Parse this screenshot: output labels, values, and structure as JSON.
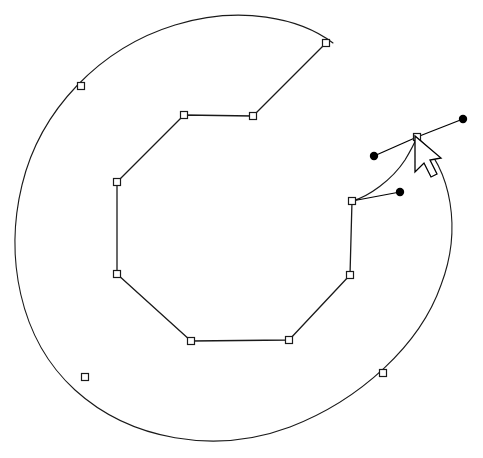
{
  "canvas": {
    "name": "vector-editing-canvas",
    "width": 483,
    "height": 458,
    "background_color": "#ffffff",
    "stroke_color": "#1a1a1a",
    "anchor_fill_color": "#ffffff",
    "anchor_stroke_color": "#1a1a1a",
    "handle_color": "#000000",
    "cursor_fill_color": "#ffffff",
    "cursor_stroke_color": "#000000"
  },
  "shapes": {
    "outer_arc": {
      "name": "outer-arc-path",
      "description": "large open circular arc forming a C shape, gap at upper right",
      "stroke_width": 1.1,
      "path": "M 417 137 C 452 170 462 230 441 285 C 420 345 360 400 290 427 C 215 455 130 440 75 390 C 18 338 5 255 22 185 C 40 110 100 48 175 25 C 240 5 300 18 333 43",
      "anchors": [
        {
          "name": "anchor-outer-top-right",
          "x": 417,
          "y": 137
        },
        {
          "name": "anchor-outer-bottom-right",
          "x": 383,
          "y": 373
        },
        {
          "name": "anchor-outer-bottom-left",
          "x": 85,
          "y": 377
        },
        {
          "name": "anchor-outer-top-left",
          "x": 81,
          "y": 86
        }
      ]
    },
    "inner_polygon": {
      "name": "inner-polygon-path",
      "description": "open polyline forming inner C shape with straight segments",
      "stroke_width": 1.3,
      "vertices": [
        {
          "name": "vertex-top-right",
          "x": 326,
          "y": 43
        },
        {
          "name": "vertex-upper-mid-right",
          "x": 253,
          "y": 116
        },
        {
          "name": "vertex-upper-mid-left",
          "x": 184,
          "y": 115
        },
        {
          "name": "vertex-left-upper",
          "x": 117,
          "y": 182
        },
        {
          "name": "vertex-left-lower",
          "x": 117,
          "y": 274
        },
        {
          "name": "vertex-bottom-left",
          "x": 191,
          "y": 341
        },
        {
          "name": "vertex-bottom-right",
          "x": 289,
          "y": 340
        },
        {
          "name": "vertex-right-lower",
          "x": 350,
          "y": 275
        },
        {
          "name": "vertex-right-upper",
          "x": 352,
          "y": 201
        }
      ]
    },
    "bezier_handles": {
      "name": "bezier-control-handles",
      "description": "three round control point dots connected to selected anchors",
      "stroke_width": 1.2,
      "dot_radius": 4.2,
      "items": [
        {
          "name": "handle-upper-right",
          "anchor_x": 417,
          "anchor_y": 137,
          "dot_x": 463,
          "dot_y": 119
        },
        {
          "name": "handle-upper-left",
          "anchor_x": 417,
          "anchor_y": 137,
          "dot_x": 374,
          "dot_y": 156
        },
        {
          "name": "handle-lower",
          "anchor_x": 352,
          "anchor_y": 201,
          "dot_x": 400,
          "dot_y": 192
        }
      ]
    },
    "curve_segment": {
      "name": "selected-curve-segment",
      "description": "curved bezier segment between the two selected anchors",
      "stroke_width": 1.2,
      "path": "M 352 201 C 368 197 392 180 405 160 C 411 150 415 142 417 137"
    }
  },
  "cursor": {
    "name": "mouse-cursor-arrow",
    "tip_x": 415,
    "tip_y": 136,
    "path": "M 415 136 L 415 172 L 424 163 L 431 177 L 437 174 L 430 160 L 441 158 Z"
  },
  "anchor_marker": {
    "name": "anchor-square-marker",
    "size": 7,
    "stroke_width": 1.2
  }
}
